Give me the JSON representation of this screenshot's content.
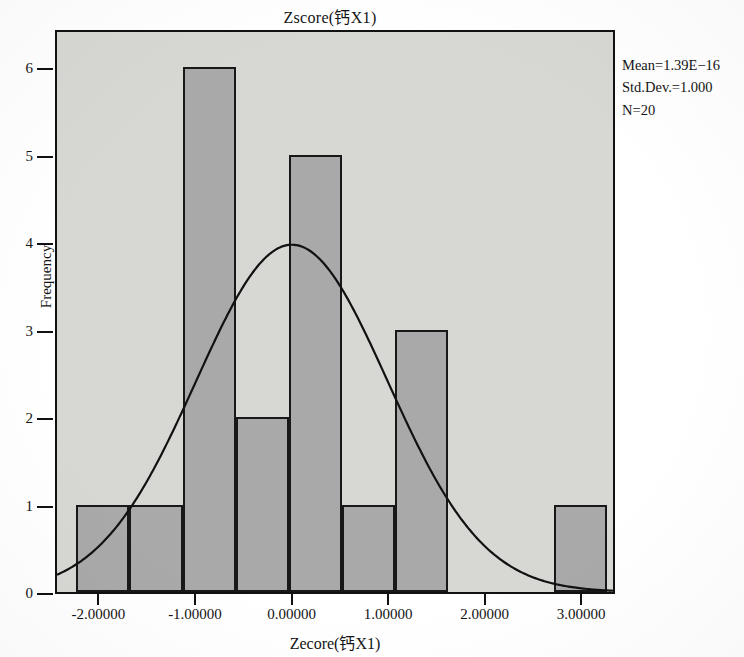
{
  "chart_data": {
    "type": "bar",
    "title": "Zscore(钙X1)",
    "xlabel": "Zecore(钙X1)",
    "ylabel": "Frequency",
    "xlim": [
      -2.45,
      3.35
    ],
    "ylim": [
      0,
      6.45
    ],
    "grid": false,
    "legend_position": "top-right",
    "bin_width": 0.55,
    "bin_starts": [
      -2.25,
      -1.7,
      -1.15,
      -0.6,
      -0.05,
      0.5,
      1.05,
      1.6,
      2.15,
      2.7
    ],
    "bin_centers": [
      -1.975,
      -1.425,
      -0.875,
      -0.325,
      0.225,
      0.775,
      1.325,
      1.875,
      2.425,
      2.975
    ],
    "values": [
      1,
      1,
      6,
      2,
      5,
      1,
      3,
      0,
      0,
      1
    ],
    "x_tick_labels": [
      "-2.00000",
      "-1.00000",
      "0.00000",
      "1.00000",
      "2.00000",
      "3.00000"
    ],
    "x_tick_values": [
      -2,
      -1,
      0,
      1,
      2,
      3
    ],
    "y_tick_labels": [
      "0",
      "1",
      "2",
      "3",
      "4",
      "5",
      "6"
    ],
    "y_tick_values": [
      0,
      1,
      2,
      3,
      4,
      5,
      6
    ],
    "overlay_curve": {
      "name": "normal",
      "mean": 0,
      "std_dev": 1,
      "peak_frequency": 4.0
    },
    "bar_fill_color": "#a9a9a9",
    "bar_edge_color": "#181818",
    "plot_background_color": "#d7d7d4",
    "curve_color": "#111111"
  },
  "stats": {
    "mean": "Mean=1.39E−16",
    "std_dev": "Std.Dev.=1.000",
    "n": "N=20"
  }
}
